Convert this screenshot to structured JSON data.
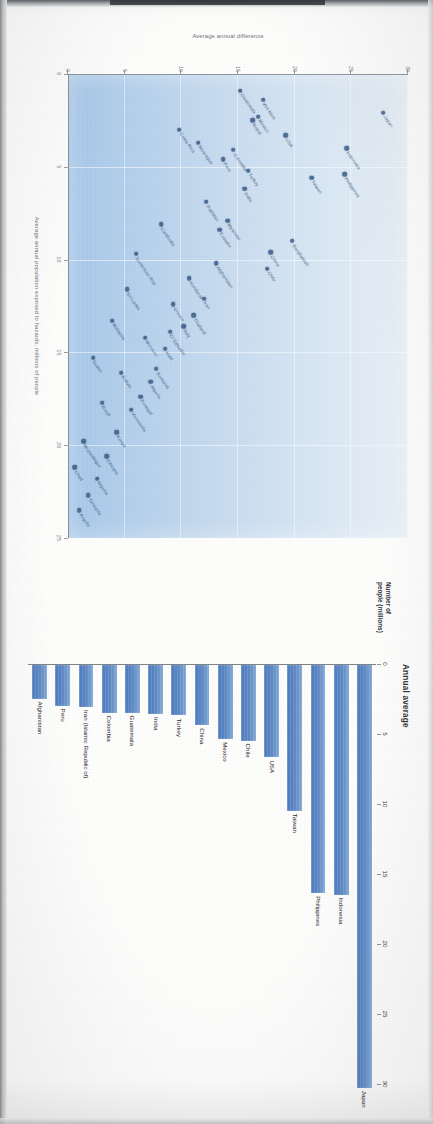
{
  "document": {
    "kind": "scanned-report-page",
    "orientation_note": "landscape charts printed on a portrait scanned page (rotated 90 degrees)"
  },
  "bar_chart": {
    "title": "Annual average",
    "y_axis_name": "Number of\npeople (millions)",
    "axis_name_line1": "Number of",
    "axis_name_line2": "people (millions)"
  },
  "scatter_chart": {
    "y_axis_label": "Average annual difference",
    "x_axis_label": "Average annual population exposed to hazards, millions of people"
  },
  "chart_data": [
    {
      "type": "bar",
      "title": "Annual average",
      "xlabel": "Number of people (millions)",
      "ylabel": "",
      "orientation": "horizontal",
      "xlim": [
        0,
        30
      ],
      "ticks": [
        0,
        5,
        10,
        15,
        20,
        25,
        30
      ],
      "grid": false,
      "legend": "none",
      "bar_color": "#5b87c4",
      "categories": [
        "Japan",
        "Indonesia",
        "Philippines",
        "Taiwan",
        "USA",
        "Chile",
        "Mexico",
        "China",
        "Turkey",
        "India",
        "Guatemala",
        "Colombia",
        "Iran (Islamic Republic of)",
        "Peru",
        "Afghanistan"
      ],
      "values": [
        30.2,
        16.4,
        16.3,
        10.4,
        6.6,
        5.4,
        5.3,
        4.3,
        3.6,
        3.5,
        3.4,
        3.4,
        3.0,
        2.9,
        2.4
      ]
    },
    {
      "type": "scatter",
      "title": "",
      "xlabel": "Average annual population exposed to hazards, millions of people",
      "ylabel": "Average annual difference",
      "xlim": [
        0,
        25
      ],
      "ylim": [
        0,
        30
      ],
      "x_ticks": [
        0,
        5,
        10,
        15,
        20,
        25
      ],
      "y_ticks": [
        0,
        5,
        10,
        15,
        20,
        25,
        30
      ],
      "grid": true,
      "legend": "none",
      "point_color": "#3d5f8a",
      "points": [
        {
          "label": "Japan",
          "x": 2.1,
          "y": 27.8
        },
        {
          "label": "Indonesia",
          "x": 4.0,
          "y": 24.6
        },
        {
          "label": "Philippines",
          "x": 5.4,
          "y": 24.4
        },
        {
          "label": "Taiwan",
          "x": 5.6,
          "y": 21.5
        },
        {
          "label": "Bangladesh",
          "x": 9.0,
          "y": 19.8
        },
        {
          "label": "USA",
          "x": 3.3,
          "y": 19.2
        },
        {
          "label": "China",
          "x": 9.6,
          "y": 17.9
        },
        {
          "label": "Chile",
          "x": 10.5,
          "y": 17.6
        },
        {
          "label": "Viet Nam",
          "x": 1.4,
          "y": 17.2
        },
        {
          "label": "Mexico",
          "x": 2.3,
          "y": 16.8
        },
        {
          "label": "Nepal",
          "x": 2.5,
          "y": 16.3
        },
        {
          "label": "Turkey",
          "x": 5.2,
          "y": 15.9
        },
        {
          "label": "India",
          "x": 6.2,
          "y": 15.6
        },
        {
          "label": "Guatemala",
          "x": 0.9,
          "y": 15.2
        },
        {
          "label": "Colombia",
          "x": 4.1,
          "y": 14.6
        },
        {
          "label": "Myanmar",
          "x": 7.9,
          "y": 14.1
        },
        {
          "label": "Peru",
          "x": 4.6,
          "y": 13.7
        },
        {
          "label": "Ecuador",
          "x": 8.4,
          "y": 13.4
        },
        {
          "label": "Afghanistan",
          "x": 10.2,
          "y": 13.1
        },
        {
          "label": "Pakistan",
          "x": 6.9,
          "y": 12.2
        },
        {
          "label": "Iran",
          "x": 12.1,
          "y": 12.0
        },
        {
          "label": "Nicaragua",
          "x": 3.7,
          "y": 11.5
        },
        {
          "label": "Thailand",
          "x": 13.0,
          "y": 11.1
        },
        {
          "label": "Honduras",
          "x": 11.0,
          "y": 10.7
        },
        {
          "label": "Italy",
          "x": 13.6,
          "y": 10.2
        },
        {
          "label": "Costa Rica",
          "x": 3.0,
          "y": 9.8
        },
        {
          "label": "Greece",
          "x": 12.4,
          "y": 9.3
        },
        {
          "label": "El Salvador",
          "x": 13.9,
          "y": 9.0
        },
        {
          "label": "Haiti",
          "x": 14.8,
          "y": 8.6
        },
        {
          "label": "Cambodia",
          "x": 8.1,
          "y": 8.2
        },
        {
          "label": "Romania",
          "x": 15.9,
          "y": 7.8
        },
        {
          "label": "Algeria",
          "x": 16.6,
          "y": 7.3
        },
        {
          "label": "Morocco",
          "x": 14.2,
          "y": 6.8
        },
        {
          "label": "Portugal",
          "x": 17.4,
          "y": 6.4
        },
        {
          "label": "Dominican Rep",
          "x": 9.7,
          "y": 6.0
        },
        {
          "label": "Venezuela",
          "x": 18.1,
          "y": 5.6
        },
        {
          "label": "Sri Lanka",
          "x": 11.6,
          "y": 5.2
        },
        {
          "label": "Bolivia",
          "x": 16.1,
          "y": 4.7
        },
        {
          "label": "Kenya",
          "x": 19.3,
          "y": 4.3
        },
        {
          "label": "Malaysia",
          "x": 13.3,
          "y": 3.9
        },
        {
          "label": "Ethiopia",
          "x": 20.6,
          "y": 3.4
        },
        {
          "label": "Brazil",
          "x": 17.7,
          "y": 3.0
        },
        {
          "label": "Nigeria",
          "x": 21.8,
          "y": 2.6
        },
        {
          "label": "Sudan",
          "x": 15.3,
          "y": 2.2
        },
        {
          "label": "Tanzania",
          "x": 22.7,
          "y": 1.8
        },
        {
          "label": "Mozambique",
          "x": 19.8,
          "y": 1.4
        },
        {
          "label": "Angola",
          "x": 23.5,
          "y": 1.0
        },
        {
          "label": "Chad",
          "x": 21.2,
          "y": 0.6
        }
      ]
    }
  ]
}
